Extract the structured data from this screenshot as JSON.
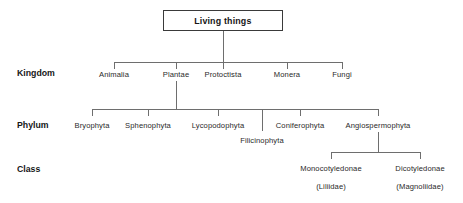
{
  "diagram": {
    "title": "Living things",
    "type": "taxonomic-hierarchy",
    "rank_labels": {
      "kingdom": "Kingdom",
      "phylum": "Phylum",
      "class": "Class"
    },
    "root": {
      "label": "Living things"
    },
    "kingdoms": [
      {
        "label": "Animalia"
      },
      {
        "label": "Plantae"
      },
      {
        "label": "Protoctista"
      },
      {
        "label": "Monera"
      },
      {
        "label": "Fungi"
      }
    ],
    "phyla": [
      {
        "label": "Bryophyta"
      },
      {
        "label": "Sphenophyta"
      },
      {
        "label": "Lycopodophyta"
      },
      {
        "label": "Filicinophyta"
      },
      {
        "label": "Coniferophyta"
      },
      {
        "label": "Angiospermophyta"
      }
    ],
    "classes": [
      {
        "label": "Monocotyledonae",
        "alt_label": "(Liliidae)"
      },
      {
        "label": "Dicotyledonae",
        "alt_label": "(Magnoliidae)"
      }
    ],
    "colors": {
      "background": "#ffffff",
      "text": "#161616",
      "node_text": "#2a2a2a",
      "line": "#6e6e6e",
      "box_border": "#3a3a3a"
    }
  }
}
